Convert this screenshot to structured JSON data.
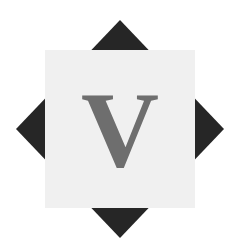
{
  "canvas": {
    "width": 238,
    "height": 250,
    "background_color": "#ffffff"
  },
  "logo": {
    "name": "v-monogram-logo",
    "description": "Eight-pointed star emblem: dark diamond behind a light square with a serif letter V",
    "letter": "V",
    "letter_color": "#6e6e6e",
    "diamond": {
      "name": "dark-diamond",
      "color": "#262626",
      "center_x": 120,
      "center_y": 129,
      "top_point_y": 20,
      "bottom_point_y": 238,
      "left_point_x": 16,
      "right_point_x": 224
    },
    "square": {
      "name": "light-square",
      "color": "#f0f0f0",
      "x": 45,
      "y": 50,
      "width": 150,
      "height": 158
    },
    "letter_box": {
      "center_x": 120,
      "center_y": 129,
      "font_size": 108
    }
  }
}
